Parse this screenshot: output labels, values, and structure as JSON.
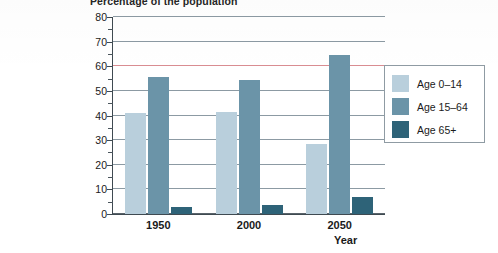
{
  "chart_data": {
    "type": "bar",
    "title": "Percentage of the population",
    "xlabel": "Year",
    "ylabel": "",
    "categories": [
      "1950",
      "2000",
      "2050"
    ],
    "series": [
      {
        "name": "Age 0–14",
        "values": [
          41,
          41.5,
          28.5
        ],
        "color": "#b9cfdc"
      },
      {
        "name": "Age 15–64",
        "values": [
          55.5,
          54.5,
          64.5
        ],
        "color": "#6b94a8"
      },
      {
        "name": "Age 65+",
        "values": [
          3,
          3.5,
          7
        ],
        "color": "#2e6378"
      }
    ],
    "ylim": [
      0,
      80
    ],
    "ytick_labels": [
      "0",
      "10",
      "20",
      "30",
      "40",
      "50",
      "60",
      "70",
      "80"
    ],
    "ytick_values": [
      0,
      10,
      20,
      30,
      40,
      50,
      60,
      70,
      80
    ],
    "yminor_values": [
      5,
      15,
      25,
      35,
      45,
      55,
      65,
      75
    ],
    "grid": true,
    "legend_position": "right",
    "accent_gridline": 60,
    "accent_gridline_color": "#d98d92",
    "gridline_color": "#8c9aa3",
    "axis_color": "#3f4a51"
  },
  "legend": {
    "items": [
      {
        "label": "Age 0–14"
      },
      {
        "label": "Age 15–64"
      },
      {
        "label": "Age 65+"
      }
    ]
  }
}
